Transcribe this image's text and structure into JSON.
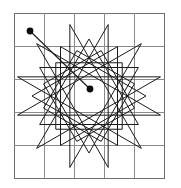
{
  "figure": {
    "background_color": "#ffffff",
    "stroke_color": "#1a1a1a",
    "grid_color": "#8a8a8a",
    "frame_color": "#6f6f6f",
    "dot_color": "#0d0d0d"
  },
  "grid": {
    "label": "5 by 5 square grid",
    "x": 14,
    "y": 13,
    "width": 150,
    "height": 165,
    "columns": 5,
    "rows": 5,
    "cell_width": 30,
    "cell_height": 33
  },
  "chart_data": {
    "type": "line",
    "xlabel": "",
    "ylabel": "",
    "xlim": [
      14,
      164
    ],
    "ylim": [
      13,
      178
    ],
    "grid": true,
    "legend": "none",
    "annotations": [
      "Start marker dot at upper left of grid",
      "End marker dot near grid centre",
      "Straight connector segment joins the two marker dots"
    ],
    "series": [
      {
        "name": "star-polygon-12-5",
        "description": "Twelve point star polygon traced by connecting every fifth vertex of twelve equally spaced points on a circle",
        "center": [
          89,
          96
        ],
        "radius": 74,
        "vertex_count": 12,
        "step": 5,
        "start_angle_deg": -105,
        "closed": true
      },
      {
        "name": "inner-rosette-12-4",
        "description": "Inner twelve point rosette connecting every fourth vertex of twelve equally spaced points",
        "center": [
          89,
          96
        ],
        "radius": 57,
        "vertex_count": 12,
        "step": 4,
        "start_angle_deg": -90,
        "closed": true
      },
      {
        "name": "inner-rosette-12-3",
        "description": "Innermost twelve point rosette connecting every third vertex",
        "center": [
          89,
          96
        ],
        "radius": 47,
        "vertex_count": 12,
        "step": 3,
        "start_angle_deg": -75,
        "closed": true
      }
    ],
    "markers": [
      {
        "name": "start-dot",
        "x": 30,
        "y": 31,
        "radius": 3.4
      },
      {
        "name": "end-dot",
        "x": 90,
        "y": 89,
        "radius": 3.4
      }
    ],
    "connector": {
      "name": "pointer-segment",
      "x1": 30,
      "y1": 31,
      "x2": 90,
      "y2": 89
    }
  }
}
